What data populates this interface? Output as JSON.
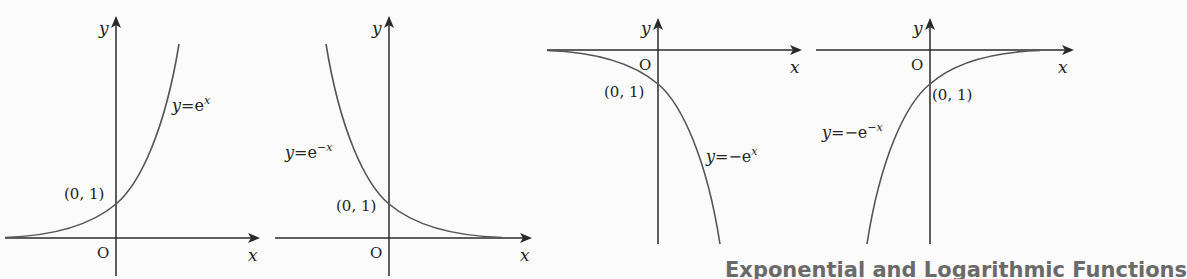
{
  "figure": {
    "panels": [
      {
        "id": "panel-1",
        "equation": {
          "lhs": "y",
          "eq": "=",
          "base": "e",
          "exp": "x",
          "sign": ""
        },
        "point_label": "(0, 1)",
        "origin_label": "O",
        "x_axis_label": "x",
        "y_axis_label": "y"
      },
      {
        "id": "panel-2",
        "equation": {
          "lhs": "y",
          "eq": "=",
          "base": "e",
          "exp": "−x",
          "sign": ""
        },
        "point_label": "(0, 1)",
        "origin_label": "O",
        "x_axis_label": "x",
        "y_axis_label": "y"
      },
      {
        "id": "panel-3",
        "equation": {
          "lhs": "y",
          "eq": "=",
          "base": "e",
          "exp": "x",
          "sign": "−"
        },
        "point_label": "(0, 1)",
        "origin_label": "O",
        "x_axis_label": "x",
        "y_axis_label": "y"
      },
      {
        "id": "panel-4",
        "equation": {
          "lhs": "y",
          "eq": "=",
          "base": "e",
          "exp": "−x",
          "sign": "−"
        },
        "point_label": "(0, 1)",
        "origin_label": "O",
        "x_axis_label": "x",
        "y_axis_label": "y"
      }
    ],
    "colors": {
      "axis": "#2a2a2a",
      "curve": "#555555",
      "text": "#222222",
      "footer": "#6a6a6a"
    }
  },
  "footer": {
    "heading": "Exponential and Logarithmic Functions"
  }
}
